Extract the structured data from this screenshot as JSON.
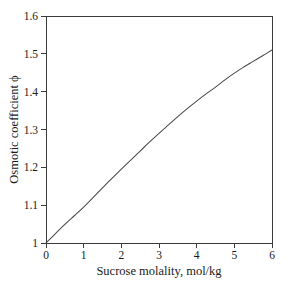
{
  "chart_data": {
    "type": "line",
    "title": "",
    "xlabel": "Sucrose molality, mol/kg",
    "ylabel": "Osmotic coefficient ϕ",
    "xlim": [
      0,
      6
    ],
    "ylim": [
      1,
      1.6
    ],
    "grid": false,
    "legend": false,
    "xticks": [
      0,
      1,
      2,
      3,
      4,
      5,
      6
    ],
    "xtick_labels": [
      "0",
      "1",
      "2",
      "3",
      "4",
      "5",
      "6"
    ],
    "yticks": [
      1,
      1.1,
      1.2,
      1.3,
      1.4,
      1.5,
      1.6
    ],
    "ytick_labels": [
      "1",
      "1.1",
      "1.2",
      "1.3",
      "1.4",
      "1.5",
      "1.6"
    ],
    "series": [
      {
        "name": "Sucrose osmotic coefficient",
        "color": "#4a4a4a",
        "x": [
          0,
          0.25,
          0.5,
          0.75,
          1,
          1.25,
          1.5,
          1.75,
          2,
          2.25,
          2.5,
          2.75,
          3,
          3.25,
          3.5,
          3.75,
          4,
          4.25,
          4.5,
          4.75,
          5,
          5.25,
          5.5,
          5.75,
          6
        ],
        "y": [
          1.0,
          1.025,
          1.049,
          1.072,
          1.095,
          1.12,
          1.146,
          1.171,
          1.195,
          1.219,
          1.243,
          1.267,
          1.29,
          1.312,
          1.334,
          1.355,
          1.375,
          1.394,
          1.412,
          1.431,
          1.449,
          1.465,
          1.48,
          1.495,
          1.51
        ]
      }
    ]
  },
  "axes": {
    "y_axis_title": "Osmotic coefficient ϕ",
    "x_axis_title": "Sucrose molality, mol/kg"
  }
}
